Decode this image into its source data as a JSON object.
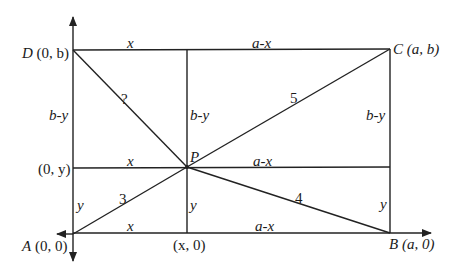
{
  "diagram": {
    "type": "geometry-rectangle-british-flag-theorem",
    "colors": {
      "line": "#222222",
      "text": "#1a1a1a",
      "background": "#ffffff"
    },
    "points": {
      "A": {
        "label": "A",
        "coords": "(0, 0)"
      },
      "B": {
        "label": "B",
        "coords": "(a, 0)"
      },
      "C": {
        "label": "C",
        "coords": "(a, b)"
      },
      "D": {
        "label": "D",
        "coords": "(0, b)"
      },
      "P": {
        "label": "P"
      },
      "y_axis_point": {
        "coords": "(0, y)"
      },
      "x_axis_point": {
        "coords": "(x, 0)"
      }
    },
    "segment_labels": {
      "top_left": "x",
      "top_right": "a-x",
      "mid_left": "x",
      "mid_right": "a-x",
      "bottom_left": "x",
      "bottom_right": "a-x",
      "left_upper": "b-y",
      "left_lower": "y",
      "center_upper": "b-y",
      "center_lower": "y",
      "right_upper": "b-y",
      "right_lower": "y"
    },
    "distances": {
      "PA": "3",
      "PB": "4",
      "PC": "5",
      "PD": "?"
    }
  }
}
